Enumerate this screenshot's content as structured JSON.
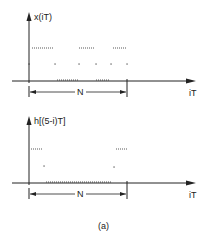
{
  "figure": {
    "caption": "(a)",
    "colors": {
      "ink": "#222222",
      "background": "#ffffff"
    }
  },
  "plots": [
    {
      "id": "top",
      "ylabel": "x(iT)",
      "xlabel": "iT",
      "period_label": "N",
      "axis": {
        "origin_x": 29,
        "baseline_y": 81,
        "top_y": 12,
        "right_x": 196
      },
      "period_bracket": {
        "y": 92,
        "x_start": 29,
        "x_end": 127
      },
      "dotted_segments": [
        {
          "y": 48,
          "x1": 32,
          "x2": 54
        },
        {
          "y": 48,
          "x1": 79,
          "x2": 94
        },
        {
          "y": 48,
          "x1": 113,
          "x2": 127
        },
        {
          "y": 80,
          "x1": 57,
          "x2": 78
        },
        {
          "y": 80,
          "x1": 96,
          "x2": 109
        }
      ],
      "dots": [
        {
          "x": 29,
          "y": 64
        },
        {
          "x": 55,
          "y": 64
        },
        {
          "x": 79,
          "y": 64
        },
        {
          "x": 96,
          "y": 64
        },
        {
          "x": 111,
          "y": 64
        },
        {
          "x": 127,
          "y": 64
        }
      ]
    },
    {
      "id": "bottom",
      "ylabel": "h[(5-i)T]",
      "xlabel": "iT",
      "period_label": "N",
      "axis": {
        "origin_x": 29,
        "baseline_y": 183,
        "top_y": 116,
        "right_x": 196
      },
      "period_bracket": {
        "y": 194,
        "x_start": 29,
        "x_end": 127
      },
      "dotted_segments": [
        {
          "y": 149,
          "x1": 31,
          "x2": 43
        },
        {
          "y": 149,
          "x1": 116,
          "x2": 128
        },
        {
          "y": 182,
          "x1": 46,
          "x2": 112
        }
      ],
      "dots": [
        {
          "x": 44,
          "y": 166
        },
        {
          "x": 114,
          "y": 167
        }
      ]
    }
  ]
}
